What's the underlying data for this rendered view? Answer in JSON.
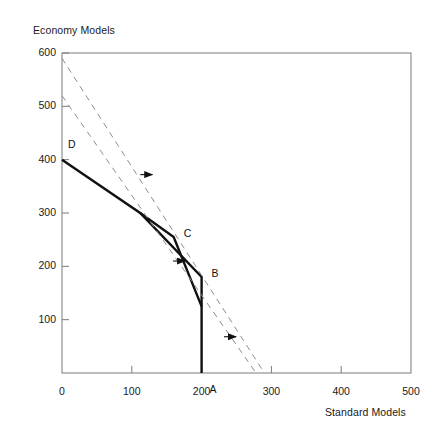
{
  "chart_data": {
    "type": "line",
    "title": "",
    "ylabel": "Economy Models",
    "xlabel": "Standard Models",
    "xlim": [
      0,
      500
    ],
    "ylim": [
      0,
      600
    ],
    "xticks": [
      0,
      100,
      200,
      300,
      400,
      500
    ],
    "yticks": [
      100,
      200,
      300,
      400,
      500,
      600
    ],
    "xtick_labels": [
      "0",
      "100",
      "200",
      "300",
      "400",
      "500"
    ],
    "ytick_labels": [
      "100",
      "200",
      "300",
      "400",
      "500",
      "600"
    ],
    "grid": false,
    "legend": "none",
    "series": [
      {
        "name": "current-frontier-upper",
        "style": "solid",
        "points": [
          [
            0,
            400
          ],
          [
            112,
            300
          ],
          [
            200,
            180
          ],
          [
            200,
            0
          ]
        ]
      },
      {
        "name": "current-frontier-lower",
        "style": "solid",
        "points": [
          [
            112,
            300
          ],
          [
            160,
            255
          ],
          [
            200,
            125
          ]
        ]
      },
      {
        "name": "expanded-frontier-outer",
        "style": "dashed",
        "points": [
          [
            0,
            590
          ],
          [
            290,
            0
          ]
        ]
      },
      {
        "name": "expanded-frontier-inner",
        "style": "dashed",
        "points": [
          [
            0,
            520
          ],
          [
            278,
            0
          ]
        ]
      }
    ],
    "annotations": [
      {
        "label": "D",
        "x": 0,
        "y": 400,
        "dx": 6,
        "dy": -16
      },
      {
        "label": "C",
        "x": 160,
        "y": 255,
        "dx": 10,
        "dy": -4
      },
      {
        "label": "B",
        "x": 200,
        "y": 180,
        "dx": 10,
        "dy": -4
      },
      {
        "label": "A",
        "x": 200,
        "y": 0,
        "dx": 8,
        "dy": 16
      }
    ],
    "arrows": [
      {
        "name": "growth-arrow-upper",
        "x": 125,
        "y": 372
      },
      {
        "name": "growth-arrow-middle",
        "x": 172,
        "y": 210
      },
      {
        "name": "growth-arrow-lower",
        "x": 245,
        "y": 68
      }
    ]
  },
  "colors": {
    "axis": "#7a7a7a",
    "solid_line": "#111111",
    "dashed_line": "#8d8d8d",
    "text": "#1a1a1a"
  }
}
